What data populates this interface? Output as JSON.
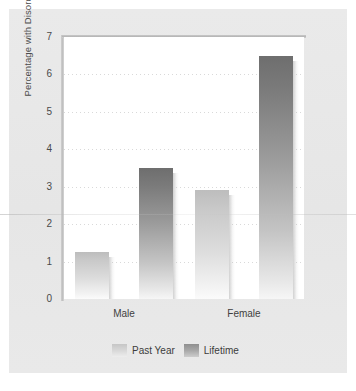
{
  "chart_data": {
    "type": "bar",
    "title": "",
    "xlabel": "",
    "ylabel": "Percentage with Disorder",
    "categories": [
      "Male",
      "Female"
    ],
    "series": [
      {
        "name": "Past Year",
        "values": [
          1.25,
          2.9
        ],
        "color": "#d2d2d2"
      },
      {
        "name": "Lifetime",
        "values": [
          3.5,
          6.5
        ],
        "color": "#8a8a8a"
      }
    ],
    "ylim": [
      0,
      7
    ],
    "ytick_labels": [
      "0",
      "1",
      "2",
      "3",
      "4",
      "5",
      "6",
      "7"
    ],
    "ytick_values": [
      0,
      1,
      2,
      3,
      4,
      5,
      6,
      7
    ],
    "grid": true,
    "legend_position": "bottom"
  },
  "colors": {
    "page_background": "#ffffff",
    "card_background": "#e8e8e8",
    "plot_background": "#ffffff",
    "gridline": "#d9d9d9",
    "axis_text": "#4a4a4a",
    "spine": "#bdbdbd"
  }
}
